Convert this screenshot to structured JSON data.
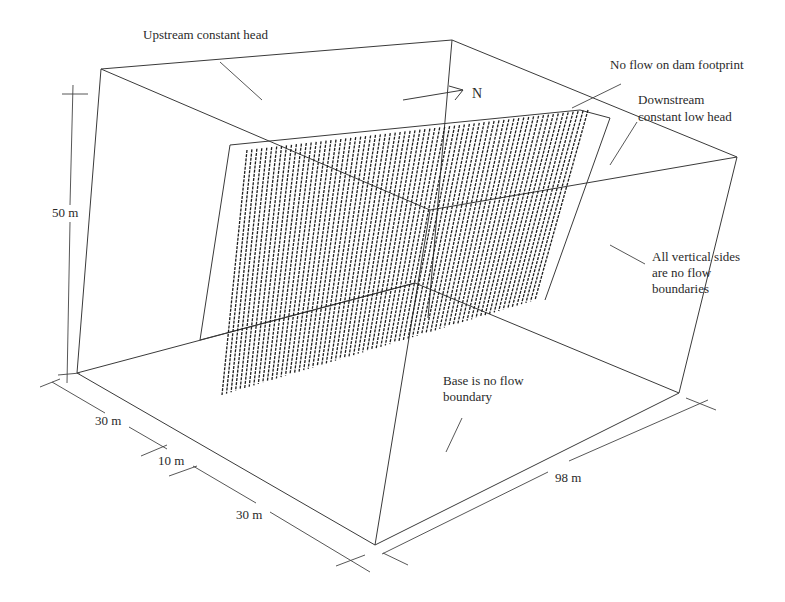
{
  "figure": {
    "north_label": "N"
  },
  "annotations": {
    "upstream": "Upstream constant head",
    "dam_footprint": "No flow on dam footprint",
    "downstream_line1": "Downstream",
    "downstream_line2": "constant low head",
    "sides_line1": "All vertical sides",
    "sides_line2": "are no flow",
    "sides_line3": "boundaries",
    "base_line1": "Base is no flow",
    "base_line2": "boundary"
  },
  "dimensions": {
    "height": "50 m",
    "width_upstream": "30 m",
    "width_dam": "10 m",
    "width_downstream": "30 m",
    "length": "98 m"
  },
  "colors": {
    "line": "#3a3a3a",
    "hatch": "#1e1e1e",
    "text": "#2a2a2a",
    "background": "#ffffff"
  }
}
